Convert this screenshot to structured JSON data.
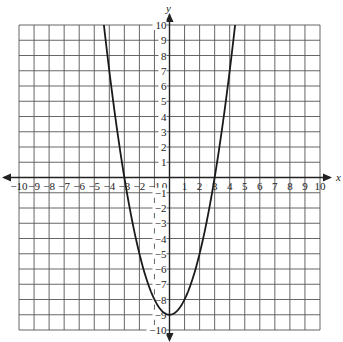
{
  "chart_data": {
    "type": "line",
    "title": "",
    "xlabel": "x",
    "ylabel": "y",
    "xlim": [
      -10,
      10
    ],
    "ylim": [
      -10,
      10
    ],
    "grid": true,
    "x_ticks": [
      -10,
      -9,
      -8,
      -7,
      -6,
      -5,
      -4,
      -3,
      -2,
      -1,
      0,
      1,
      2,
      3,
      4,
      5,
      6,
      7,
      8,
      9,
      10
    ],
    "y_ticks": [
      -10,
      -9,
      -8,
      -7,
      -6,
      -5,
      -4,
      -3,
      -2,
      -1,
      1,
      2,
      3,
      4,
      5,
      6,
      7,
      8,
      9,
      10
    ],
    "series": [
      {
        "name": "parabola",
        "equation": "y = x^2 - 9",
        "vertex": [
          0,
          -9
        ],
        "x_intercepts": [
          -3,
          3
        ],
        "y_intercept": -9,
        "x": [
          -4.36,
          -4,
          -3,
          -2,
          -1,
          0,
          1,
          2,
          3,
          4,
          4.36
        ],
        "y": [
          10,
          7,
          0,
          -5,
          -8,
          -9,
          -8,
          -5,
          0,
          7,
          10
        ]
      }
    ]
  },
  "labels": {
    "x_axis": "x",
    "y_axis": "y",
    "origin": "0"
  }
}
